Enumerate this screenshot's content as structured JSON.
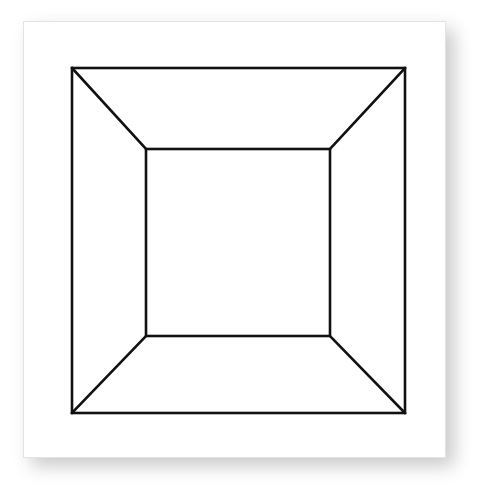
{
  "page": {
    "background_color": "#ffffff",
    "width": 479,
    "height": 488
  },
  "card": {
    "background_color": "#ffffff",
    "border_color": "#e3e3e3",
    "shadow_color": "#9d9d9d",
    "x": 23,
    "y": 21,
    "width": 423,
    "height": 437,
    "alt_text": "Line drawing of a truncated pyramid seen head on: a large square with a smaller concentric square inside, corners joined by four diagonal lines."
  },
  "figure": {
    "name": "square-frustum",
    "stroke_color": "#111111",
    "stroke_width": 2.6,
    "fill": "none",
    "outer_square": {
      "label": "outer square",
      "top_left": [
        48,
        46
      ],
      "top_right": [
        381,
        46
      ],
      "bottom_right": [
        381,
        391
      ],
      "bottom_left": [
        48,
        391
      ],
      "width": 333,
      "height": 345
    },
    "inner_square": {
      "label": "inner square",
      "top_left": [
        122,
        127
      ],
      "top_right": [
        306,
        127
      ],
      "bottom_right": [
        306,
        314
      ],
      "bottom_left": [
        122,
        314
      ],
      "width": 184,
      "height": 187
    },
    "diagonals": [
      {
        "label": "top-left diagonal",
        "from": [
          48,
          46
        ],
        "to": [
          122,
          127
        ]
      },
      {
        "label": "top-right diagonal",
        "from": [
          381,
          46
        ],
        "to": [
          306,
          127
        ]
      },
      {
        "label": "bottom-right diagonal",
        "from": [
          381,
          391
        ],
        "to": [
          306,
          314
        ]
      },
      {
        "label": "bottom-left diagonal",
        "from": [
          48,
          391
        ],
        "to": [
          122,
          314
        ]
      }
    ],
    "faces": [
      {
        "label": "top trapezoid face"
      },
      {
        "label": "right trapezoid face"
      },
      {
        "label": "bottom trapezoid face"
      },
      {
        "label": "left trapezoid face"
      },
      {
        "label": "center square face"
      }
    ]
  }
}
